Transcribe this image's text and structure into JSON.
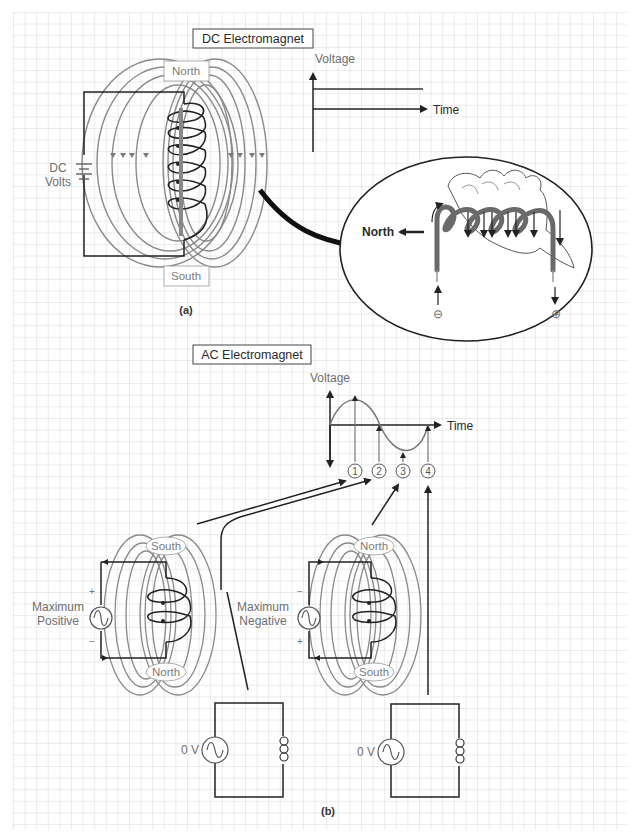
{
  "colors": {
    "grid": "#c9c9c9",
    "field_lines": "#8a8a8a",
    "wire": "#222222",
    "label_text": "#6f6f6f",
    "background": "#ffffff"
  },
  "panel_a": {
    "title": "DC Electromagnet",
    "caption": "(a)",
    "pole_top": "North",
    "pole_bottom": "South",
    "source_label_line1": "DC",
    "source_label_line2": "Volts",
    "graph": {
      "y_axis_label": "Voltage",
      "x_axis_label": "Time"
    },
    "inset": {
      "direction_label": "North",
      "left_terminal": "⊖",
      "right_terminal": "⊕"
    }
  },
  "panel_b": {
    "title": "AC Electromagnet",
    "caption": "(b)",
    "graph": {
      "y_axis_label": "Voltage",
      "x_axis_label": "Time",
      "markers": [
        "1",
        "2",
        "3",
        "4"
      ]
    },
    "coil_left": {
      "source_label_line1": "Maximum",
      "source_label_line2": "Positive",
      "pole_top": "South",
      "pole_bottom": "North",
      "sign_top": "+",
      "sign_bottom": "−"
    },
    "coil_right": {
      "source_label_line1": "Maximum",
      "source_label_line2": "Negative",
      "pole_top": "North",
      "pole_bottom": "South",
      "sign_top": "−",
      "sign_bottom": "+"
    },
    "circuit_left": {
      "source_label": "0 V"
    },
    "circuit_right": {
      "source_label": "0 V"
    }
  }
}
